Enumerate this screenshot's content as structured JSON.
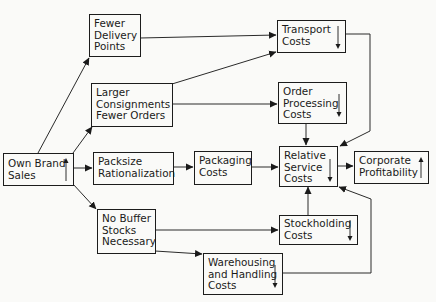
{
  "nodes": {
    "own_brand_sales": {
      "label": "Own Brand\nSales",
      "trend": "up"
    },
    "fewer_delivery_points": {
      "label": "Fewer\nDelivery\nPoints"
    },
    "larger_consignments": {
      "label": "Larger\nConsignments\nFewer Orders"
    },
    "packsize_rationalization": {
      "label": "Packsize\nRationalization"
    },
    "no_buffer_stocks": {
      "label": "No Buffer\nStocks\nNecessary"
    },
    "transport_costs": {
      "label": "Transport\nCosts",
      "trend": "down"
    },
    "order_processing_costs": {
      "label": "Order\nProcessing\nCosts",
      "trend": "down"
    },
    "packaging_costs": {
      "label": "Packaging\nCosts"
    },
    "relative_service_costs": {
      "label": "Relative\nService\nCosts",
      "trend": "down"
    },
    "corporate_profitability": {
      "label": "Corporate\nProfitability",
      "trend": "up"
    },
    "stockholding_costs": {
      "label": "Stockholding\nCosts",
      "trend": "down"
    },
    "warehousing_handling_costs": {
      "label": "Warehousing\nand Handling\nCosts",
      "trend": "down"
    }
  },
  "edges": [
    {
      "from": "own_brand_sales",
      "to": "fewer_delivery_points"
    },
    {
      "from": "own_brand_sales",
      "to": "larger_consignments"
    },
    {
      "from": "own_brand_sales",
      "to": "packsize_rationalization"
    },
    {
      "from": "own_brand_sales",
      "to": "no_buffer_stocks"
    },
    {
      "from": "fewer_delivery_points",
      "to": "transport_costs"
    },
    {
      "from": "larger_consignments",
      "to": "transport_costs"
    },
    {
      "from": "larger_consignments",
      "to": "order_processing_costs"
    },
    {
      "from": "packsize_rationalization",
      "to": "packaging_costs"
    },
    {
      "from": "packaging_costs",
      "to": "relative_service_costs"
    },
    {
      "from": "order_processing_costs",
      "to": "relative_service_costs"
    },
    {
      "from": "transport_costs",
      "to": "relative_service_costs"
    },
    {
      "from": "no_buffer_stocks",
      "to": "stockholding_costs"
    },
    {
      "from": "no_buffer_stocks",
      "to": "warehousing_handling_costs"
    },
    {
      "from": "stockholding_costs",
      "to": "relative_service_costs"
    },
    {
      "from": "warehousing_handling_costs",
      "to": "relative_service_costs"
    },
    {
      "from": "relative_service_costs",
      "to": "corporate_profitability"
    }
  ]
}
